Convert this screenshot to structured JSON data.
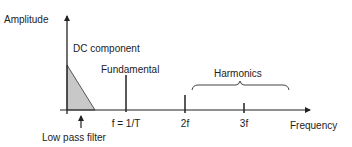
{
  "diagram": {
    "type": "frequency-spectrum",
    "colors": {
      "line": "#222222",
      "filter_fill": "#c8c8c8",
      "filter_stroke": "#555555",
      "brace": "#444444"
    },
    "axes": {
      "y_label": "Amplitude",
      "x_label": "Frequency"
    },
    "annotations": {
      "dc_component": "DC component",
      "fundamental": "Fundamental",
      "harmonics": "Harmonics",
      "low_pass_filter": "Low pass filter"
    },
    "ticks": [
      {
        "label": "f = 1/T",
        "name": "fundamental",
        "relative_height": 1.0
      },
      {
        "label": "2f",
        "name": "second-harmonic",
        "relative_height": 0.5
      },
      {
        "label": "3f",
        "name": "third-harmonic",
        "relative_height": 0.25
      }
    ]
  }
}
